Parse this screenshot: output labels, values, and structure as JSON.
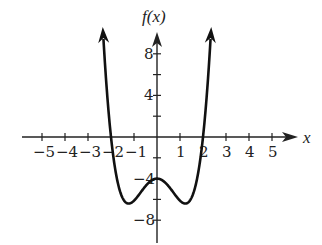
{
  "chart_data": {
    "type": "line",
    "title": "",
    "xlabel": "x",
    "ylabel": "f(x)",
    "xlim": [
      -5.7,
      6.3
    ],
    "ylim": [
      -10.5,
      10.5
    ],
    "x_ticks": [
      -5,
      -4,
      -3,
      -2,
      -1,
      1,
      2,
      3,
      4,
      5
    ],
    "x_tick_labels": [
      "−5",
      "−4",
      "−3",
      "−2",
      "−1",
      "1",
      "2",
      "3",
      "4",
      "5"
    ],
    "y_ticks": [
      -8,
      -6,
      -4,
      -2,
      2,
      4,
      6,
      8
    ],
    "y_tick_labels": [
      {
        "value": 8,
        "label": "8"
      },
      {
        "value": 4,
        "label": "4"
      },
      {
        "value": -4,
        "label": "−4"
      },
      {
        "value": -8,
        "label": "−8"
      }
    ],
    "grid": false,
    "legend": null,
    "series": [
      {
        "name": "f(x)",
        "description": "even quartic, W-shaped, arrows at both ends pointing up",
        "key_points": [
          {
            "x": -2.3,
            "y": 10
          },
          {
            "x": -2,
            "y": 0
          },
          {
            "x": -1.25,
            "y": -6.4
          },
          {
            "x": 0,
            "y": -4
          },
          {
            "x": 1.25,
            "y": -6.4
          },
          {
            "x": 2,
            "y": 0
          },
          {
            "x": 2.3,
            "y": 10
          }
        ],
        "model": {
          "a4": 1.04,
          "a2": -3.16,
          "a0": -4
        }
      }
    ]
  },
  "geometry": {
    "origin_px": [
      157,
      137
    ],
    "px_per_x_unit": 23,
    "px_per_y_unit": 10.4,
    "x_axis_start_px": 22,
    "x_axis_end_px": 298,
    "y_axis_top_px": 32,
    "y_axis_bottom_px": 243
  }
}
